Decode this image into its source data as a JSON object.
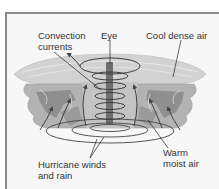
{
  "figure": {
    "labels": {
      "convection_currents": "Convection\ncurrents",
      "convection_line1": "Convection",
      "convection_line2": "currents",
      "eye": "Eye",
      "cool_dense_air": "Cool dense air",
      "hurricane_winds_line1": "Hurricane winds",
      "hurricane_winds_line2": "and rain",
      "warm_moist_air_line1": "Warm",
      "warm_moist_air_line2": "moist air"
    },
    "colors": {
      "cloud_top": "#cfcfcf",
      "cloud_mid": "#a9a9a9",
      "cloud_dark": "#8a8a8a",
      "eye_column": "#6f6f6f",
      "arrows": "#444444",
      "background": "#f7f7f7"
    }
  }
}
